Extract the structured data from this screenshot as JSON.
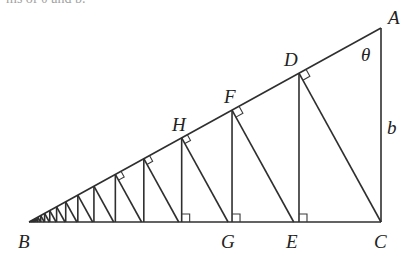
{
  "caption": "ms of θ and b.",
  "diagram": {
    "points": {
      "A": {
        "x": 381,
        "y": 28
      },
      "B": {
        "x": 29,
        "y": 222
      },
      "C": {
        "x": 381,
        "y": 222
      }
    },
    "ratio": 0.752,
    "steps": 18,
    "labels": [
      {
        "id": "A",
        "text": "A",
        "x": 388,
        "y": 24
      },
      {
        "id": "B",
        "text": "B",
        "x": 18,
        "y": 248
      },
      {
        "id": "C",
        "text": "C",
        "x": 374,
        "y": 248
      },
      {
        "id": "D",
        "text": "D",
        "x": 284,
        "y": 66
      },
      {
        "id": "E",
        "text": "E",
        "x": 286,
        "y": 248
      },
      {
        "id": "F",
        "text": "F",
        "x": 224,
        "y": 103
      },
      {
        "id": "G",
        "text": "G",
        "x": 221,
        "y": 248
      },
      {
        "id": "H",
        "text": "H",
        "x": 172,
        "y": 131
      },
      {
        "id": "theta",
        "text": "θ",
        "x": 361,
        "y": 61
      },
      {
        "id": "b",
        "text": "b",
        "x": 387,
        "y": 134
      }
    ],
    "right_angle_marks_base": 5,
    "right_angle_marks_hyp": 5,
    "colors": {
      "line": "#2f2f2f",
      "label": "#222222",
      "background": "#ffffff"
    }
  }
}
